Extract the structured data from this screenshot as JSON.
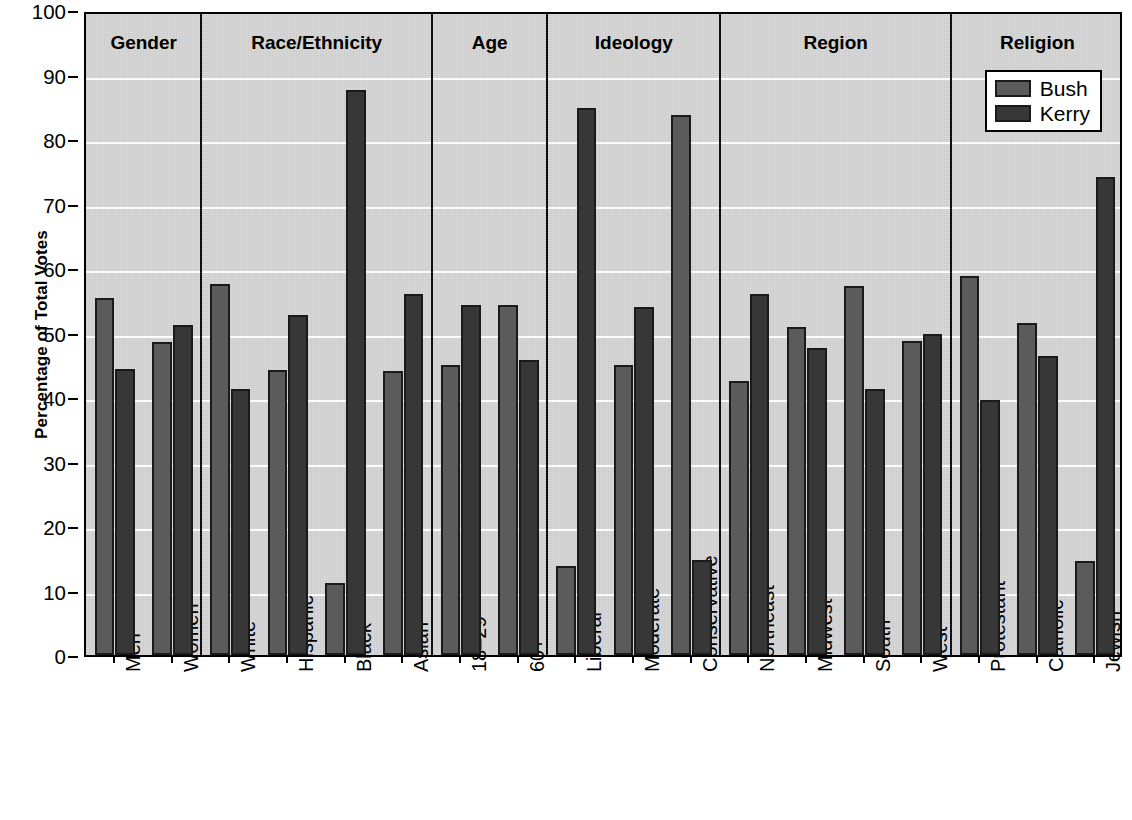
{
  "chart_data": {
    "type": "bar",
    "title": "",
    "xlabel": "",
    "ylabel": "Percentage of Total Votes",
    "ylim": [
      0,
      100
    ],
    "yticks": [
      0,
      10,
      20,
      30,
      40,
      50,
      60,
      70,
      80,
      90,
      100
    ],
    "grid": true,
    "legend_position": "top-right",
    "legend": [
      "Bush",
      "Kerry"
    ],
    "series": [
      {
        "name": "Bush",
        "color": "#5b5b5b",
        "values": [
          55.3,
          48.6,
          57.5,
          44.2,
          11.2,
          44.1,
          45.0,
          54.2,
          13.8,
          44.9,
          83.7,
          42.5,
          50.8,
          57.2,
          48.7,
          58.7,
          51.4,
          14.6
        ]
      },
      {
        "name": "Kerry",
        "color": "#373737",
        "values": [
          44.4,
          51.1,
          41.2,
          52.7,
          87.6,
          56.0,
          54.2,
          45.8,
          84.8,
          53.9,
          14.8,
          56.0,
          47.6,
          41.2,
          49.8,
          39.5,
          46.3,
          74.1
        ]
      }
    ],
    "categories": [
      "Men",
      "Women",
      "White",
      "Hispanic",
      "Black",
      "Asian",
      "18–29",
      "60+",
      "Liberal",
      "Moderate",
      "Conservative",
      "Northeast",
      "Midwest",
      "South",
      "West",
      "Protestant",
      "Catholic",
      "Jewish"
    ],
    "groups": [
      {
        "label": "Gender",
        "categories": [
          "Men",
          "Women"
        ]
      },
      {
        "label": "Race/Ethnicity",
        "categories": [
          "White",
          "Hispanic",
          "Black",
          "Asian"
        ]
      },
      {
        "label": "Age",
        "categories": [
          "18–29",
          "60+"
        ]
      },
      {
        "label": "Ideology",
        "categories": [
          "Liberal",
          "Moderate",
          "Conservative"
        ]
      },
      {
        "label": "Region",
        "categories": [
          "Northeast",
          "Midwest",
          "South",
          "West"
        ]
      },
      {
        "label": "Religion",
        "categories": [
          "Protestant",
          "Catholic",
          "Jewish"
        ]
      }
    ],
    "colors": {
      "plot_background": "#d2d2d2",
      "gridline": "#ffffff",
      "axis": "#000000",
      "bush": "#5b5b5b",
      "kerry": "#373737"
    }
  }
}
